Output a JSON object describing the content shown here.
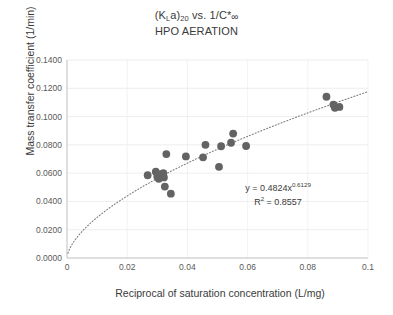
{
  "chart_data": {
    "type": "scatter",
    "title_lines": [
      "(KLa)20 vs. 1/C*∞",
      "HPO AERATION"
    ],
    "title_main_prefix": "(K",
    "title_main_sub1": "L",
    "title_main_mid": "a)",
    "title_main_sub2": "20",
    "title_main_rest": " vs. 1/C*",
    "title_main_inf": "∞",
    "title_second": "HPO AERATION",
    "xlabel": "Reciprocal of saturation concentration (L/mg)",
    "ylabel": "Mass transfer coefficient (1/min)",
    "xlim": [
      0,
      0.1
    ],
    "ylim": [
      0,
      0.14
    ],
    "xticks": [
      "0",
      "0.02",
      "0.04",
      "0.06",
      "0.08",
      "0.1"
    ],
    "xtick_values": [
      0,
      0.02,
      0.04,
      0.06,
      0.08,
      0.1
    ],
    "yticks": [
      "0.0000",
      "0.0200",
      "0.0400",
      "0.0600",
      "0.0800",
      "0.1000",
      "0.1200",
      "0.1400"
    ],
    "ytick_values": [
      0,
      0.02,
      0.04,
      0.06,
      0.08,
      0.1,
      0.12,
      0.14
    ],
    "grid": "horizontal-and-vertical-light",
    "legend": "none",
    "marker_color": "#636363",
    "trendline_color": "#7f7f7f",
    "trendline_style": "dotted",
    "points": [
      {
        "x": 0.0268,
        "y": 0.0585
      },
      {
        "x": 0.0295,
        "y": 0.061
      },
      {
        "x": 0.03,
        "y": 0.0575
      },
      {
        "x": 0.0305,
        "y": 0.056
      },
      {
        "x": 0.0313,
        "y": 0.0592
      },
      {
        "x": 0.032,
        "y": 0.06
      },
      {
        "x": 0.0322,
        "y": 0.057
      },
      {
        "x": 0.0325,
        "y": 0.0505
      },
      {
        "x": 0.033,
        "y": 0.0735
      },
      {
        "x": 0.0345,
        "y": 0.0455
      },
      {
        "x": 0.0395,
        "y": 0.0718
      },
      {
        "x": 0.0452,
        "y": 0.0712
      },
      {
        "x": 0.046,
        "y": 0.08
      },
      {
        "x": 0.0505,
        "y": 0.0645
      },
      {
        "x": 0.0512,
        "y": 0.079
      },
      {
        "x": 0.0545,
        "y": 0.0815
      },
      {
        "x": 0.0552,
        "y": 0.088
      },
      {
        "x": 0.0595,
        "y": 0.0792
      },
      {
        "x": 0.0862,
        "y": 0.114
      },
      {
        "x": 0.0885,
        "y": 0.1085
      },
      {
        "x": 0.089,
        "y": 0.1062
      },
      {
        "x": 0.0905,
        "y": 0.1068
      }
    ],
    "trendline": {
      "equation_text": "y = 0.4824x",
      "equation_exponent": "0.6129",
      "r2_prefix": "R",
      "r2_sup": "2",
      "r2_text": " = 0.8557",
      "coefficient": 0.4824,
      "exponent": 0.6129,
      "r_squared": 0.8557,
      "model": "power"
    }
  }
}
